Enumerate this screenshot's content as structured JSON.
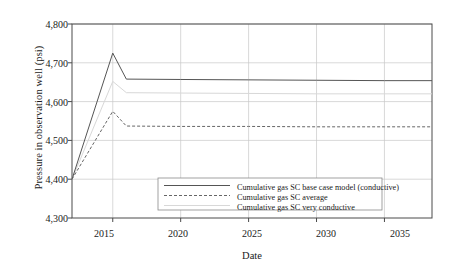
{
  "chart_data": {
    "type": "line",
    "title": "",
    "xlabel": "Date",
    "ylabel": "Pressure in observation well (psi)",
    "xlim": [
      2012.0,
      2038.5
    ],
    "ylim": [
      4300,
      4800
    ],
    "xticks": [
      "2015",
      "2020",
      "2025",
      "2030",
      "2035"
    ],
    "xtick_values": [
      2015,
      2020,
      2025,
      2030,
      2035
    ],
    "yticks": [
      "4,300",
      "4,400",
      "4,500",
      "4,600",
      "4,700",
      "4,800"
    ],
    "ytick_values": [
      4300,
      4400,
      4500,
      4600,
      4700,
      4800
    ],
    "grid": true,
    "legend_position": "lower center",
    "series": [
      {
        "name": "Cumulative gas SC base case model (conductive)",
        "style": "solid",
        "color": "#555555",
        "x": [
          2012.0,
          2015.0,
          2016.0,
          2020.0,
          2025.0,
          2030.0,
          2035.0,
          2038.5
        ],
        "y": [
          4400,
          4725,
          4658,
          4657,
          4656,
          4655,
          4654,
          4654
        ]
      },
      {
        "name": "Cumulative gas SC average",
        "style": "dashed",
        "color": "#666666",
        "x": [
          2012.0,
          2015.0,
          2016.0,
          2020.0,
          2025.0,
          2030.0,
          2035.0,
          2038.5
        ],
        "y": [
          4400,
          4575,
          4537,
          4536,
          4536,
          4535,
          4535,
          4535
        ]
      },
      {
        "name": "Cumulative gas SC very conductive",
        "style": "solid",
        "color": "#d8d8d8",
        "x": [
          2012.0,
          2015.0,
          2016.0,
          2020.0,
          2025.0,
          2030.0,
          2035.0,
          2038.5
        ],
        "y": [
          4400,
          4652,
          4623,
          4622,
          4621,
          4620,
          4620,
          4620
        ]
      }
    ]
  }
}
